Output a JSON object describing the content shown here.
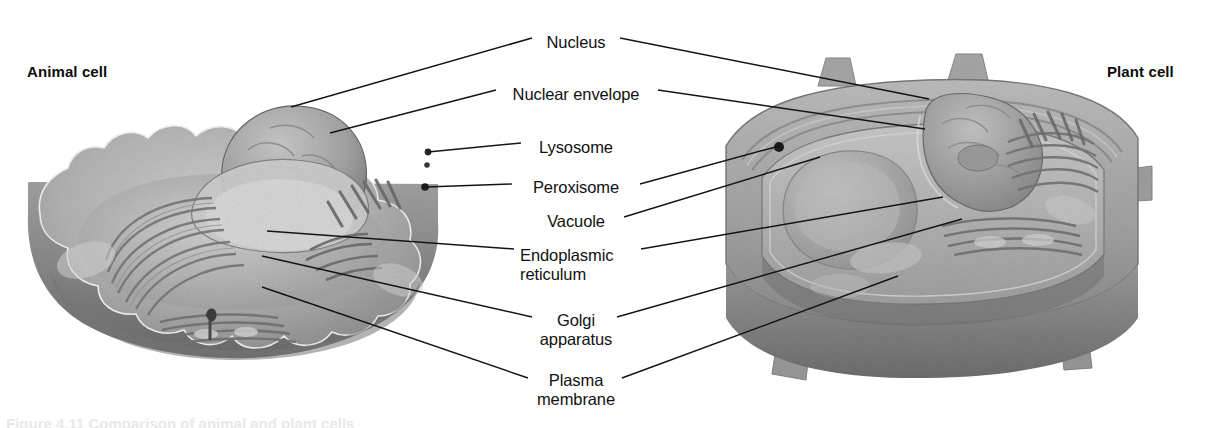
{
  "figure": {
    "background_color": "#ffffff",
    "line_color": "#141414",
    "text_color": "#111111",
    "width": 1208,
    "height": 428,
    "style": "grayscale airbrush biological illustration"
  },
  "headings": {
    "animal": "Animal cell",
    "plant": "Plant cell"
  },
  "labels": [
    {
      "id": "nucleus",
      "text": "Nucleus",
      "line2": "",
      "x": 576,
      "y": 33,
      "align": "center",
      "points_to": [
        "animal",
        "plant"
      ]
    },
    {
      "id": "nuclear-envelope",
      "text": "Nuclear envelope",
      "line2": "",
      "x": 576,
      "y": 85,
      "align": "center",
      "points_to": [
        "animal",
        "plant"
      ]
    },
    {
      "id": "lysosome",
      "text": "Lysosome",
      "line2": "",
      "x": 576,
      "y": 138,
      "align": "center",
      "points_to": [
        "animal"
      ]
    },
    {
      "id": "peroxisome",
      "text": "Peroxisome",
      "line2": "",
      "x": 576,
      "y": 178,
      "align": "center",
      "points_to": [
        "animal",
        "plant"
      ]
    },
    {
      "id": "vacuole",
      "text": "Vacuole",
      "line2": "",
      "x": 576,
      "y": 212,
      "align": "center",
      "points_to": [
        "plant"
      ]
    },
    {
      "id": "endoplasmic-reticulum",
      "text": "Endoplasmic",
      "line2": "reticulum",
      "x": 576,
      "y": 246,
      "align": "center",
      "points_to": [
        "animal",
        "plant"
      ]
    },
    {
      "id": "golgi-apparatus",
      "text": "Golgi",
      "line2": "apparatus",
      "x": 576,
      "y": 311,
      "align": "center",
      "points_to": [
        "animal",
        "plant"
      ]
    },
    {
      "id": "plasma-membrane",
      "text": "Plasma",
      "line2": "membrane",
      "x": 576,
      "y": 371,
      "align": "center",
      "points_to": [
        "animal",
        "plant"
      ]
    }
  ],
  "leader_lines": [
    {
      "label": "nucleus",
      "side": "left",
      "x1": 532,
      "y1": 38,
      "x2": 291,
      "y2": 107
    },
    {
      "label": "nucleus",
      "side": "right",
      "x1": 620,
      "y1": 38,
      "x2": 929,
      "y2": 99
    },
    {
      "label": "nuclear-envelope",
      "side": "left",
      "x1": 496,
      "y1": 90,
      "x2": 330,
      "y2": 133
    },
    {
      "label": "nuclear-envelope",
      "side": "right",
      "x1": 658,
      "y1": 90,
      "x2": 925,
      "y2": 129
    },
    {
      "label": "lysosome",
      "side": "left",
      "x1": 521,
      "y1": 143,
      "x2": 428,
      "y2": 152
    },
    {
      "label": "peroxisome",
      "side": "left",
      "x1": 512,
      "y1": 184,
      "x2": 426,
      "y2": 187
    },
    {
      "label": "peroxisome",
      "side": "right",
      "x1": 640,
      "y1": 184,
      "x2": 779,
      "y2": 146
    },
    {
      "label": "vacuole",
      "side": "right",
      "x1": 624,
      "y1": 217,
      "x2": 820,
      "y2": 157
    },
    {
      "label": "endoplasmic-reticulum",
      "side": "left",
      "x1": 514,
      "y1": 249,
      "x2": 267,
      "y2": 231
    },
    {
      "label": "endoplasmic-reticulum",
      "side": "right",
      "x1": 641,
      "y1": 249,
      "x2": 943,
      "y2": 197
    },
    {
      "label": "golgi-apparatus",
      "side": "left",
      "x1": 532,
      "y1": 317,
      "x2": 262,
      "y2": 256
    },
    {
      "label": "golgi-apparatus",
      "side": "right",
      "x1": 617,
      "y1": 317,
      "x2": 962,
      "y2": 219
    },
    {
      "label": "plasma-membrane",
      "side": "left",
      "x1": 528,
      "y1": 378,
      "x2": 262,
      "y2": 287
    },
    {
      "label": "plasma-membrane",
      "side": "right",
      "x1": 622,
      "y1": 378,
      "x2": 898,
      "y2": 276
    }
  ],
  "artwork": {
    "animal_cell": {
      "description": "Flattened disc-shaped animal cell with scalloped wavy plasma membrane, cut away to reveal a large domed nucleus, nucleolus, stacked endoplasmic reticulum sheets, Golgi apparatus, and small lysosome and peroxisome vesicles near the right rim.",
      "organelles": [
        "nucleus",
        "nuclear envelope",
        "lysosome",
        "peroxisome",
        "endoplasmic reticulum",
        "Golgi apparatus",
        "plasma membrane"
      ]
    },
    "plant_cell": {
      "description": "Box-shaped plant cell with thick rigid cell wall and corner protrusions, cut away to show a large vacuole on the left, a central nucleus, endoplasmic reticulum, Golgi apparatus, and a peroxisome dot near the vacuole edge.",
      "organelles": [
        "nucleus",
        "nuclear envelope",
        "peroxisome",
        "vacuole",
        "endoplasmic reticulum",
        "Golgi apparatus",
        "plasma membrane",
        "cell wall"
      ]
    }
  },
  "caption_remnant": "Figure 4.11 Comparison of animal and plant cells"
}
